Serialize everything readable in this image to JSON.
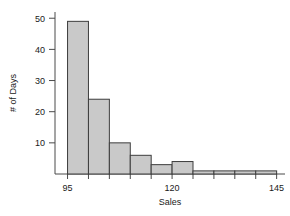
{
  "chart_data": {
    "type": "bar",
    "title": "",
    "subtitle": "",
    "xlabel": "Sales",
    "ylabel": "# of Days",
    "grid": false,
    "legend": false,
    "bin_width": 5,
    "bin_starts": [
      95,
      100,
      105,
      110,
      115,
      120,
      125,
      130,
      135,
      140
    ],
    "bin_ends": [
      100,
      105,
      110,
      115,
      120,
      125,
      130,
      135,
      140,
      145
    ],
    "categories": [
      "95-100",
      "100-105",
      "105-110",
      "110-115",
      "115-120",
      "120-125",
      "125-130",
      "130-135",
      "135-140",
      "140-145"
    ],
    "values": [
      49,
      24,
      10,
      6,
      3,
      4,
      1,
      1,
      1,
      1
    ],
    "xlim": [
      92,
      147
    ],
    "ylim": [
      0,
      52
    ],
    "xticks": [
      95,
      120,
      145
    ],
    "xtick_labels": [
      "95",
      "120",
      "145"
    ],
    "yticks": [
      10,
      20,
      30,
      40,
      50
    ],
    "ytick_labels": [
      "10",
      "20",
      "30",
      "40",
      "50"
    ],
    "bar_fill_color": "#c9c9c9",
    "bar_edge_color": "#3d3d3d",
    "axis_color": "#4a4a4a"
  }
}
